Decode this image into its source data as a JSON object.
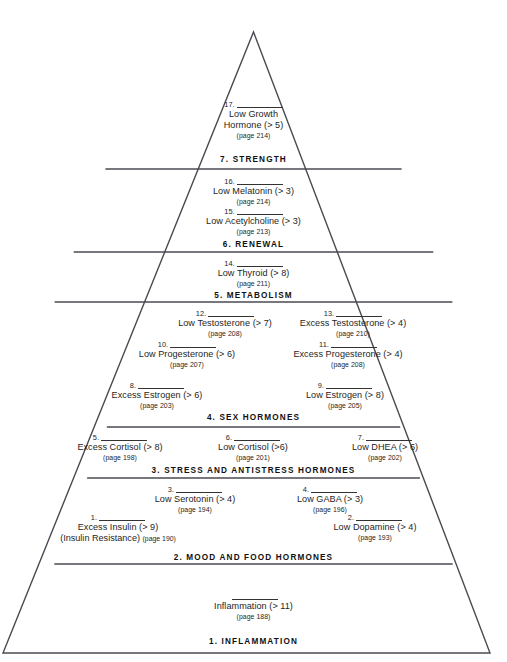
{
  "diagram": {
    "type": "pyramid",
    "title_implicit": "Hormone Hierarchy Pyramid",
    "levels": [
      {
        "number": "7",
        "label": "7. STRENGTH",
        "items": [
          {
            "num": "17.",
            "name": "Low Growth",
            "name2": "Hormone (> 5)",
            "page": "(page 214)"
          }
        ]
      },
      {
        "number": "6",
        "label": "6. RENEWAL",
        "items": [
          {
            "num": "16.",
            "name": "Low Melatonin (> 3)",
            "page": "(page 214)"
          },
          {
            "num": "15.",
            "name": "Low Acetylcholine (> 3)",
            "page": "(page 213)"
          }
        ]
      },
      {
        "number": "5",
        "label": "5. METABOLISM",
        "items": [
          {
            "num": "14.",
            "name": "Low Thyroid (> 8)",
            "page": "(page 211)"
          }
        ]
      },
      {
        "number": "4",
        "label": "4. SEX HORMONES",
        "items": [
          {
            "num": "12.",
            "name": "Low Testosterone (> 7)",
            "page": "(page 208)"
          },
          {
            "num": "13.",
            "name": "Excess Testosterone (> 4)",
            "page": "(page 210)"
          },
          {
            "num": "10.",
            "name": "Low Progesterone (> 6)",
            "page": "(page 207)"
          },
          {
            "num": "11.",
            "name": "Excess Progesterone (> 4)",
            "page": "(page 208)"
          },
          {
            "num": "8.",
            "name": "Excess Estrogen (> 6)",
            "page": "(page 203)"
          },
          {
            "num": "9.",
            "name": "Low Estrogen (> 8)",
            "page": "(page 205)"
          }
        ]
      },
      {
        "number": "3",
        "label": "3. STRESS AND ANTISTRESS HORMONES",
        "items": [
          {
            "num": "5.",
            "name": "Excess Cortisol (> 8)",
            "page": "(page 198)"
          },
          {
            "num": "6.",
            "name": "Low Cortisol (>6)",
            "page": "(page 201)"
          },
          {
            "num": "7.",
            "name": "Low DHEA (> 6)",
            "page": "(page 202)"
          }
        ]
      },
      {
        "number": "2",
        "label": "2. MOOD AND FOOD HORMONES",
        "items": [
          {
            "num": "3.",
            "name": "Low Serotonin (> 4)",
            "page": "(page 194)"
          },
          {
            "num": "4.",
            "name": "Low GABA (> 3)",
            "page": "(page 196)"
          },
          {
            "num": "1.",
            "name": "Excess Insulin (> 9)",
            "name2": "(Insulin Resistance)",
            "page": "(page 190)"
          },
          {
            "num": "2.",
            "name": "Low Dopamine (> 4)",
            "page": "(page 193)"
          }
        ]
      },
      {
        "number": "1",
        "label": "1. INFLAMMATION",
        "items": [
          {
            "num": "",
            "name": "Inflammation (> 11)",
            "page": "(page 188)"
          }
        ]
      }
    ]
  },
  "colors": {
    "outline": "#4a4a52",
    "divider": "#4a4a52",
    "text": "#1e1e1e",
    "heading": "#111111",
    "background": "#ffffff"
  }
}
